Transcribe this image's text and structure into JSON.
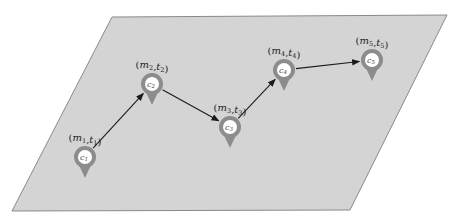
{
  "diagram": {
    "type": "trajectory-on-plane",
    "colors": {
      "background": "#ffffff",
      "plane_fill": "#d4d4d4",
      "plane_stroke": "#8a8a8a",
      "pin_fill": "#8c8c8c",
      "pin_inner": "#ffffff",
      "arrow": "#1a1a1a"
    },
    "plane": {
      "points": [
        [
          112,
          17
        ],
        [
          447,
          15
        ],
        [
          350,
          210
        ],
        [
          12,
          211
        ]
      ]
    },
    "nodes": [
      {
        "id": "c1",
        "pin_text": "c1",
        "label": "(m1, t1)",
        "x": 85,
        "y": 157
      },
      {
        "id": "c2",
        "pin_text": "c2",
        "label": "(m2, t2)",
        "x": 152,
        "y": 84
      },
      {
        "id": "c3",
        "pin_text": "c3",
        "label": "(m3, t3)",
        "x": 230,
        "y": 127
      },
      {
        "id": "c4",
        "pin_text": "c4",
        "label": "(m4, t4)",
        "x": 284,
        "y": 70
      },
      {
        "id": "c5",
        "pin_text": "c5",
        "label": "(m5, t5)",
        "x": 372,
        "y": 60
      }
    ],
    "edges": [
      {
        "from": "c1",
        "to": "c2"
      },
      {
        "from": "c2",
        "to": "c3"
      },
      {
        "from": "c3",
        "to": "c4"
      },
      {
        "from": "c4",
        "to": "c5"
      }
    ]
  }
}
